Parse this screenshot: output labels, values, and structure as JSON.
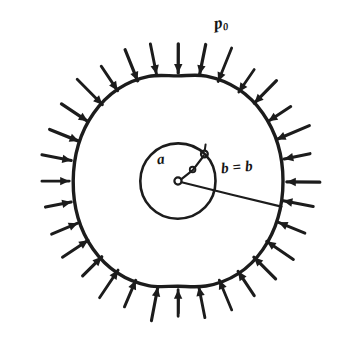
{
  "figure": {
    "kind": "engineering-diagram",
    "background_color": "#ffffff",
    "ink_color": "#1c1c1c"
  },
  "labels": {
    "external_pressure": {
      "symbol": "p",
      "subscript": "0",
      "full_text": "p0"
    },
    "inner_radius": {
      "symbol": "a",
      "full_text": "a"
    },
    "outer_radius": {
      "symbol": "b",
      "equals": "=",
      "value_symbol": "b",
      "full_text": "b = b"
    }
  },
  "geometry": {
    "center": {
      "x": 178,
      "y": 181
    },
    "outer_circle": {
      "radius": 105,
      "stroke_width": 3.2
    },
    "inner_circle": {
      "radius": 38,
      "stroke_width": 2.4
    },
    "center_marker": {
      "radius": 3.4
    },
    "radius_line_a": {
      "angle_degrees": -52,
      "end_marker_radius": 3.2,
      "elbow": true
    },
    "radius_line_b": {
      "angle_degrees": 13,
      "stroke_width": 2.0
    },
    "pressure_arrows": {
      "count": 32,
      "tail_radius": 139,
      "head_radius": 108,
      "stroke_width": 3.0,
      "direction": "inward",
      "head_length": 9,
      "head_half_width": 4.2
    },
    "bottom_tick": {
      "angle_degrees": 90,
      "inner_radius": 117,
      "outer_radius": 130
    }
  },
  "chart_data": {
    "type": "diagram",
    "title": "",
    "annotations": [
      "p0",
      "a",
      "b = b"
    ],
    "elements": [
      {
        "name": "outer-boundary",
        "shape": "circle",
        "radius": 105
      },
      {
        "name": "inner-boundary",
        "shape": "circle",
        "radius": 38
      },
      {
        "name": "external-pressure-arrows",
        "shape": "radial-arrows",
        "count": 32,
        "direction": "inward"
      },
      {
        "name": "inner-radius-dimension",
        "shape": "line",
        "label": "a"
      },
      {
        "name": "outer-radius-dimension",
        "shape": "line",
        "label": "b"
      }
    ]
  }
}
